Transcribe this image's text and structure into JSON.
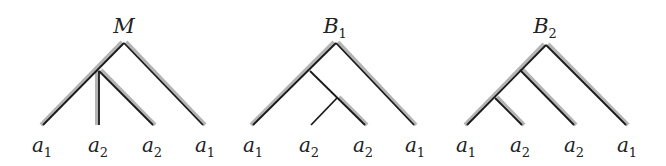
{
  "diagram": {
    "type": "tree-comparison",
    "colors": {
      "edge": "#1a1a1a",
      "shade": "#b4b4b4",
      "text": "#222222"
    },
    "trees": [
      {
        "id": "M",
        "title": "M",
        "title_sub": "",
        "title_pos": [
          124,
          33
        ],
        "edges_shade": [
          [
            [
              124,
              43
            ],
            [
              43,
              125
            ]
          ],
          [
            [
              124,
              43
            ],
            [
              203,
              125
            ]
          ],
          [
            [
              99,
              71
            ],
            [
              153,
              125
            ]
          ],
          [
            [
              99,
              71
            ],
            [
              99,
              125
            ]
          ]
        ],
        "edges": [
          [
            [
              124,
              43
            ],
            [
              43,
              125
            ]
          ],
          [
            [
              124,
              43
            ],
            [
              203,
              125
            ]
          ],
          [
            [
              99,
              71
            ],
            [
              99,
              125
            ]
          ],
          [
            [
              99,
              71
            ],
            [
              153,
              125
            ]
          ]
        ],
        "leaves": [
          {
            "name": "a",
            "sub": "1",
            "x": 42
          },
          {
            "name": "a",
            "sub": "2",
            "x": 98
          },
          {
            "name": "a",
            "sub": "2",
            "x": 152
          },
          {
            "name": "a",
            "sub": "1",
            "x": 205
          }
        ]
      },
      {
        "id": "B1",
        "title": "B",
        "title_sub": "1",
        "title_pos": [
          335,
          33
        ],
        "edges_shade": [
          [
            [
              336,
              43
            ],
            [
              253,
              125
            ]
          ],
          [
            [
              336,
              43
            ],
            [
              414,
              125
            ]
          ],
          [
            [
              337,
              98
            ],
            [
              365,
              125
            ]
          ]
        ],
        "edges": [
          [
            [
              336,
              43
            ],
            [
              253,
              125
            ]
          ],
          [
            [
              336,
              43
            ],
            [
              414,
              125
            ]
          ],
          [
            [
              310,
              71
            ],
            [
              365,
              125
            ]
          ],
          [
            [
              337,
              98
            ],
            [
              311,
              125
            ]
          ]
        ],
        "leaves": [
          {
            "name": "a",
            "sub": "1",
            "x": 253
          },
          {
            "name": "a",
            "sub": "2",
            "x": 309
          },
          {
            "name": "a",
            "sub": "2",
            "x": 363
          },
          {
            "name": "a",
            "sub": "1",
            "x": 415
          }
        ]
      },
      {
        "id": "B2",
        "title": "B",
        "title_sub": "2",
        "title_pos": [
          545,
          33
        ],
        "edges_shade": [
          [
            [
              546,
              45
            ],
            [
              467,
              125
            ]
          ],
          [
            [
              546,
              45
            ],
            [
              626,
              125
            ]
          ],
          [
            [
              520,
              70
            ],
            [
              574,
              125
            ]
          ],
          [
            [
              495,
              98
            ],
            [
              522,
              125
            ]
          ]
        ],
        "edges": [
          [
            [
              546,
              45
            ],
            [
              467,
              125
            ]
          ],
          [
            [
              546,
              45
            ],
            [
              626,
              125
            ]
          ],
          [
            [
              520,
              70
            ],
            [
              574,
              125
            ]
          ],
          [
            [
              495,
              98
            ],
            [
              522,
              125
            ]
          ]
        ],
        "leaves": [
          {
            "name": "a",
            "sub": "1",
            "x": 466
          },
          {
            "name": "a",
            "sub": "2",
            "x": 520
          },
          {
            "name": "a",
            "sub": "2",
            "x": 574
          },
          {
            "name": "a",
            "sub": "1",
            "x": 627
          }
        ]
      }
    ]
  }
}
